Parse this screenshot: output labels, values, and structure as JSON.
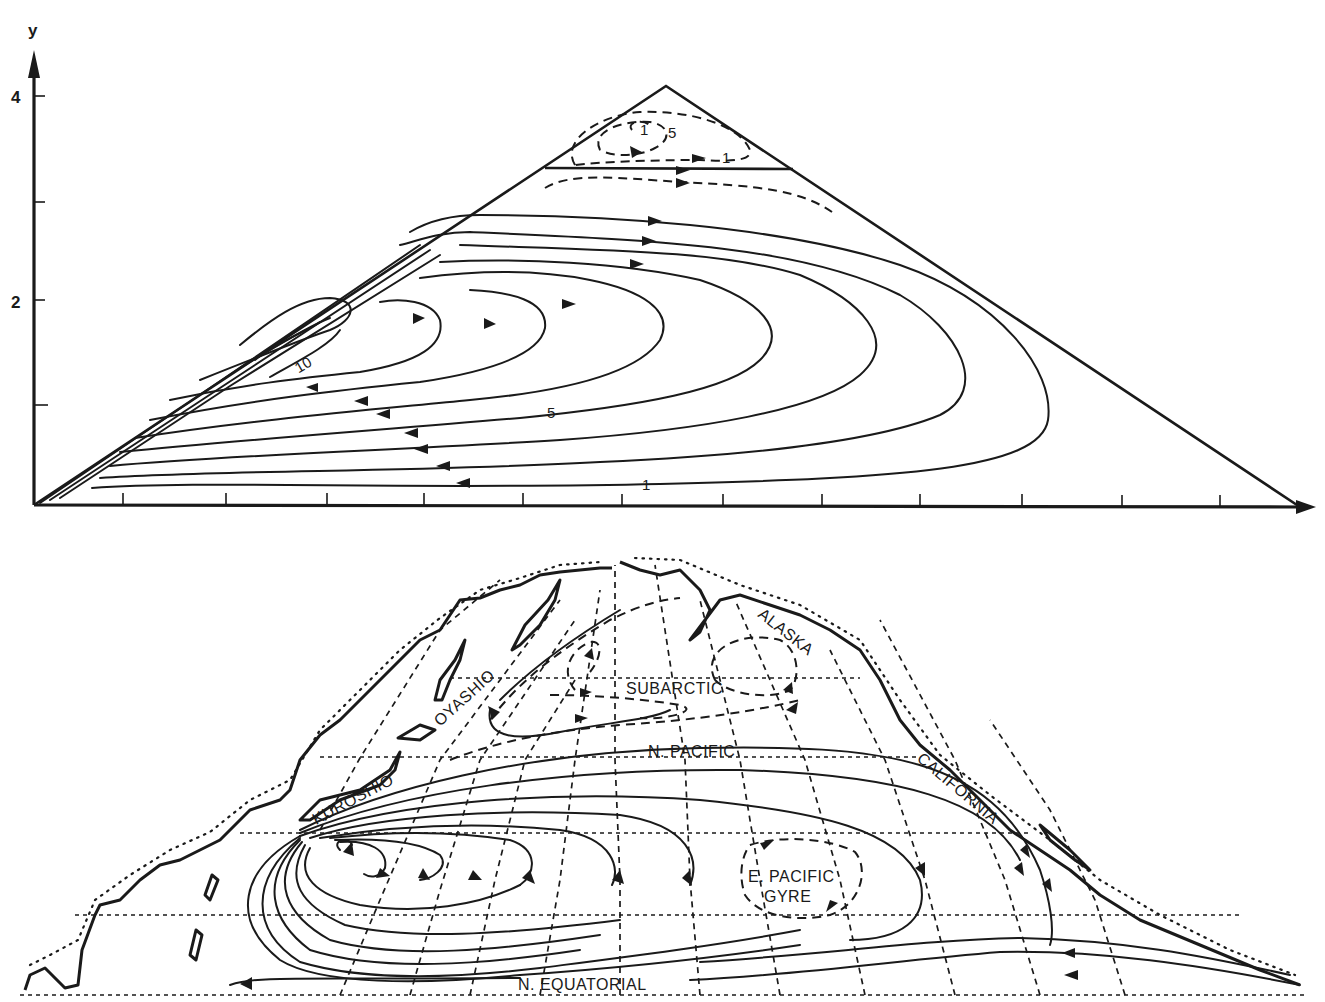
{
  "figure": {
    "panels": [
      {
        "id": "model",
        "description": "Streamlines of theoretical wind-driven circulation in a triangular basin",
        "y_axis": {
          "label": "y",
          "ticks": [
            {
              "value": "",
              "y": 405
            },
            {
              "value": "2",
              "y": 300
            },
            {
              "value": "",
              "y": 202
            },
            {
              "value": "4",
              "y": 96
            }
          ]
        },
        "x_axis": {
          "ticks_count": 12
        },
        "contour_labels": {
          "upper_max": "1",
          "upper_mid": "5",
          "upper_outer": "1",
          "gyre_max": "10",
          "gyre_mid": "5",
          "gyre_outer": "1"
        }
      },
      {
        "id": "map",
        "description": "North Pacific surface currents",
        "current_labels": {
          "alaska": "ALASKA",
          "subarctic": "SUBARCTIC",
          "oyashio": "OYASHIO",
          "n_pacific": "N. PACIFIC",
          "kuroshio": "KUROSHIO",
          "california": "CALIFORNIA",
          "e_pacific_gyre_line1": "E. PACIFIC",
          "e_pacific_gyre_line2": "GYRE",
          "n_equatorial": "N. EQUATORIAL"
        }
      }
    ]
  },
  "colors": {
    "ink": "#1a1a1a",
    "paper": "#ffffff"
  }
}
